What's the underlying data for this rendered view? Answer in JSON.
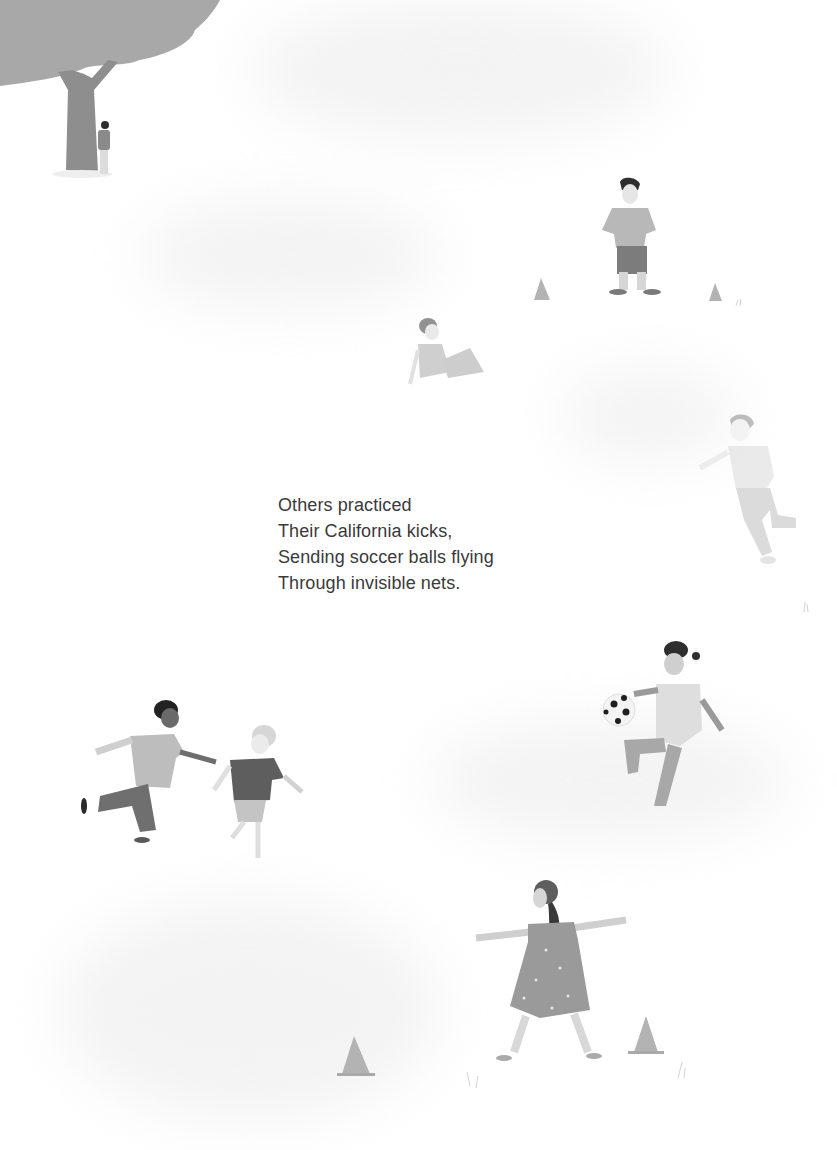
{
  "text": {
    "lines": [
      "Others practiced",
      "Their California kicks,",
      "Sending soccer balls flying",
      "Through invisible nets."
    ]
  },
  "illustration": {
    "style": "grayscale picture-book illustration",
    "elements": [
      "tree-top-left",
      "child-behind-tree",
      "boy-hands-on-hips",
      "boy-reclining",
      "boy-running-right",
      "girl-juggling-ball",
      "two-boys-running",
      "girl-in-dress-arms-out",
      "cones"
    ]
  },
  "colors": {
    "background": "#ffffff",
    "text": "#3a3a3a",
    "tree_canopy": "#a8a8a8",
    "tree_trunk": "#8e8e8e",
    "hair_dark": "#2e2e2e",
    "shirt_light": "#bdbdbd",
    "pants_mid": "#8a8a8a",
    "cone": "#b3b3b3"
  }
}
